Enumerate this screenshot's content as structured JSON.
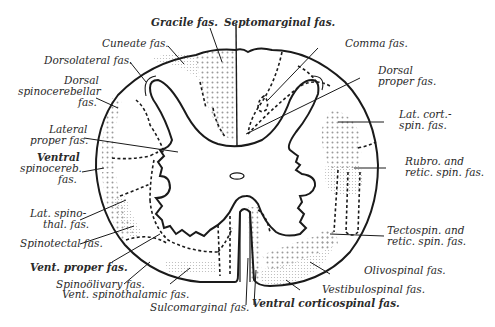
{
  "diagram": {
    "labels": {
      "gracile": "Gracile fas.",
      "septomarginal": "Septomarginal fas.",
      "cuneate": "Cuneate fas.",
      "comma": "Comma fas.",
      "dorsolateral": "Dorsolateral fas.",
      "dorsal_proper_1": "Dorsal",
      "dorsal_proper_2": "proper fas.",
      "dorsal_spinocerebellar_1": "Dorsal",
      "dorsal_spinocerebellar_2": "spinocerebellar",
      "dorsal_spinocerebellar_3": "fas.",
      "lat_cort_spin_1": "Lat. cort.-",
      "lat_cort_spin_2": "spin. fas.",
      "lateral_proper_1": "Lateral",
      "lateral_proper_2": "proper fas.",
      "rubro_retic_1": "Rubro. and",
      "rubro_retic_2": "retic. spin. fas.",
      "ventral_spinocereb_1": "Ventral",
      "ventral_spinocereb_2": "spinocereb.",
      "ventral_spinocereb_3": "fas.",
      "lat_spinothal_1": "Lat. spino-",
      "lat_spinothal_2": "thal. fas.",
      "tectospin_retic_1": "Tectospin. and",
      "tectospin_retic_2": "retic. spin. fas.",
      "spinotectal": "Spinotectal fas.",
      "vent_proper": "Vent. proper fas.",
      "olivospinal": "Olivospinal fas.",
      "spinoolivary": "Spinoölivary fas.",
      "vent_spinothalamic": "Vent. spinothalamic fas.",
      "vestibulospinal": "Vestibulospinal fas.",
      "sulcomarginal": "Sulcomarginal fas.",
      "ventral_corticospinal": "Ventral corticospinal fas."
    }
  }
}
